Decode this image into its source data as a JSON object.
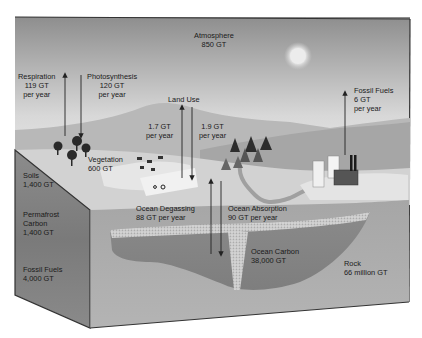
{
  "atmosphere": {
    "name": "Atmosphere",
    "amount": "850 GT"
  },
  "fluxes": {
    "respiration": {
      "name": "Respiration",
      "amount": "119 GT",
      "unit": "per year"
    },
    "photosynthesis": {
      "name": "Photosynthesis",
      "amount": "120 GT",
      "unit": "per year"
    },
    "land_use": {
      "name": "Land Use",
      "up_amount": "1.7 GT",
      "up_unit": "per year",
      "down_amount": "1.9 GT",
      "down_unit": "per year"
    },
    "fossil_fuels": {
      "name": "Fossil Fuels",
      "amount": "6 GT",
      "unit": "per year"
    },
    "ocean_degassing": {
      "name": "Ocean Degassing",
      "amount": "88 GT per year"
    },
    "ocean_absorption": {
      "name": "Ocean Absorption",
      "amount": "90 GT per year"
    }
  },
  "reservoirs": {
    "vegetation": {
      "name": "Vegetation",
      "amount": "600 GT"
    },
    "soils": {
      "name": "Soils",
      "amount": "1,400 GT"
    },
    "permafrost": {
      "name_line1": "Permafrost",
      "name_line2": "Carbon",
      "amount": "1,400 GT"
    },
    "fossil_fuels": {
      "name": "Fossil Fuels",
      "amount": "4,000 GT"
    },
    "ocean_carbon": {
      "name": "Ocean Carbon",
      "amount": "38,000 GT"
    },
    "rock": {
      "name": "Rock",
      "amount": "66 million GT"
    }
  },
  "icons": [
    "sun-icon",
    "tree-icon",
    "conifer-icon",
    "factory-icon",
    "building-icon",
    "tractor-icon",
    "cattle-icon"
  ]
}
